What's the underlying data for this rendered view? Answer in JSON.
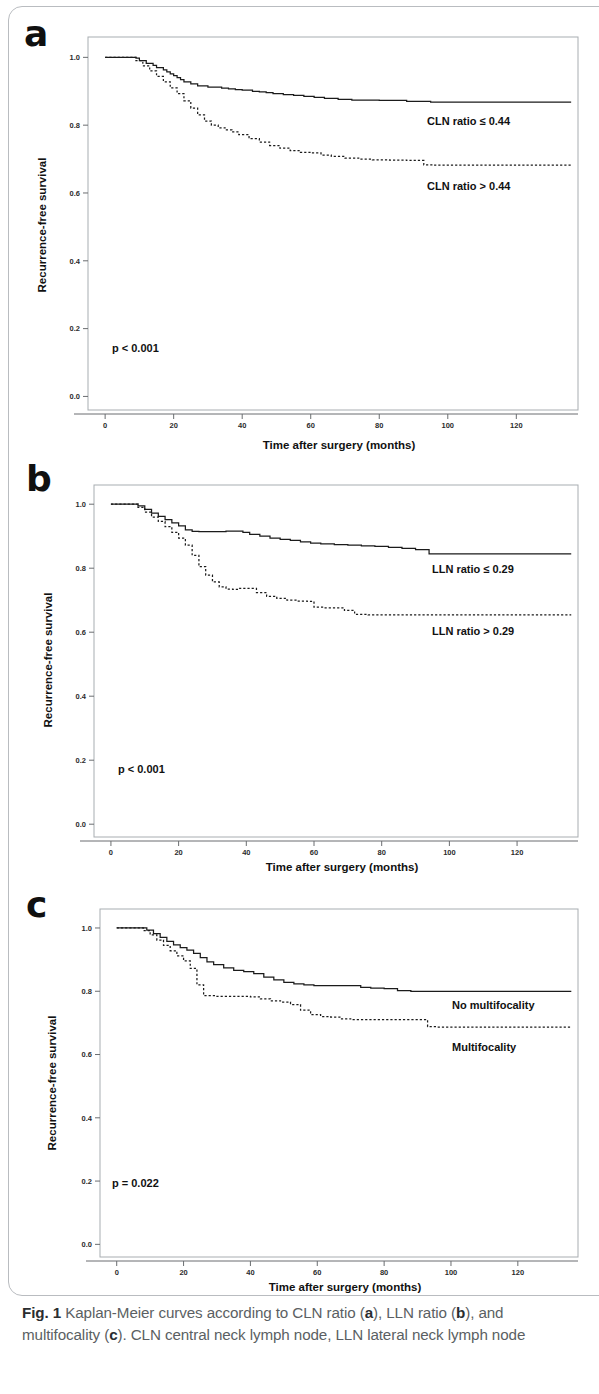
{
  "figure": {
    "caption_prefix": "Fig. 1",
    "caption_text_1": " Kaplan-Meier curves according to CLN ratio (",
    "caption_a": "a",
    "caption_text_2": "), LLN ratio (",
    "caption_b": "b",
    "caption_text_3": "), and multifocality (",
    "caption_c": "c",
    "caption_text_4": "). CLN central neck lymph node, LLN lateral neck lymph node"
  },
  "common": {
    "xlabel": "Time after surgery (months)",
    "ylabel": "Recurrence-free survival",
    "xticks": [
      "0",
      "20",
      "40",
      "60",
      "80",
      "100",
      "120"
    ],
    "yticks": [
      "0.0",
      "0.2",
      "0.4",
      "0.6",
      "0.8",
      "1.0"
    ]
  },
  "panels": [
    {
      "letter": "a",
      "pvalue": "p < 0.001",
      "label_upper": "CLN ratio ≤ 0.44",
      "label_lower": "CLN ratio > 0.44"
    },
    {
      "letter": "b",
      "pvalue": "p < 0.001",
      "label_upper": "LLN ratio ≤ 0.29",
      "label_lower": "LLN ratio > 0.29"
    },
    {
      "letter": "c",
      "pvalue": "p = 0.022",
      "label_upper": "No multifocality",
      "label_lower": "Multifocality"
    }
  ],
  "chart_data": [
    {
      "type": "line",
      "panel": "a",
      "title": "Kaplan-Meier curves according to CLN ratio",
      "xlabel": "Time after surgery (months)",
      "ylabel": "Recurrence-free survival",
      "xlim": [
        -5,
        138
      ],
      "ylim": [
        -0.04,
        1.06
      ],
      "xticks": [
        0,
        20,
        40,
        60,
        80,
        100,
        120
      ],
      "yticks": [
        0.0,
        0.2,
        0.4,
        0.6,
        0.8,
        1.0
      ],
      "grid": false,
      "legend": "inline-annotation",
      "annotations": [
        "p < 0.001"
      ],
      "series": [
        {
          "name": "CLN ratio ≤ 0.44",
          "style": "solid",
          "x": [
            0,
            7,
            9,
            10,
            12,
            14,
            15,
            17,
            18,
            19,
            20,
            21,
            22,
            23,
            25,
            27,
            30,
            32,
            34,
            36,
            38,
            40,
            43,
            45,
            47,
            49,
            52,
            55,
            58,
            61,
            64,
            68,
            72,
            74,
            80,
            88,
            95,
            105,
            120,
            136
          ],
          "y": [
            1.0,
            1.0,
            0.998,
            0.99,
            0.982,
            0.976,
            0.97,
            0.963,
            0.957,
            0.951,
            0.946,
            0.94,
            0.934,
            0.928,
            0.922,
            0.916,
            0.912,
            0.912,
            0.909,
            0.907,
            0.905,
            0.903,
            0.9,
            0.898,
            0.896,
            0.893,
            0.89,
            0.888,
            0.885,
            0.882,
            0.879,
            0.876,
            0.874,
            0.874,
            0.873,
            0.87,
            0.868,
            0.868,
            0.868,
            0.868
          ]
        },
        {
          "name": "CLN ratio > 0.44",
          "style": "dotted",
          "x": [
            0,
            7,
            9,
            11,
            13,
            15,
            17,
            19,
            21,
            23,
            25,
            27,
            29,
            31,
            33,
            35,
            37,
            39,
            42,
            45,
            48,
            51,
            54,
            57,
            60,
            63,
            66,
            70,
            74,
            78,
            83,
            88,
            93,
            96,
            105,
            120,
            136
          ],
          "y": [
            1.0,
            1.0,
            0.99,
            0.975,
            0.96,
            0.944,
            0.928,
            0.91,
            0.893,
            0.872,
            0.85,
            0.83,
            0.812,
            0.8,
            0.792,
            0.786,
            0.78,
            0.772,
            0.76,
            0.75,
            0.74,
            0.732,
            0.725,
            0.72,
            0.718,
            0.712,
            0.708,
            0.703,
            0.7,
            0.698,
            0.697,
            0.696,
            0.683,
            0.682,
            0.682,
            0.682,
            0.682
          ]
        }
      ]
    },
    {
      "type": "line",
      "panel": "b",
      "title": "Kaplan-Meier curves according to LLN ratio",
      "xlabel": "Time after surgery (months)",
      "ylabel": "Recurrence-free survival",
      "xlim": [
        -5,
        138
      ],
      "ylim": [
        -0.04,
        1.06
      ],
      "xticks": [
        0,
        20,
        40,
        60,
        80,
        100,
        120
      ],
      "yticks": [
        0.0,
        0.2,
        0.4,
        0.6,
        0.8,
        1.0
      ],
      "grid": false,
      "legend": "inline-annotation",
      "annotations": [
        "p < 0.001"
      ],
      "series": [
        {
          "name": "LLN ratio ≤ 0.29",
          "style": "solid",
          "x": [
            0,
            6,
            8,
            10,
            12,
            14,
            16,
            18,
            20,
            22,
            24,
            26,
            30,
            34,
            37,
            39,
            41,
            44,
            47,
            50,
            53,
            56,
            59,
            62,
            66,
            70,
            74,
            78,
            82,
            86,
            90,
            94,
            96,
            105,
            120,
            136
          ],
          "y": [
            1.0,
            1.0,
            0.995,
            0.984,
            0.972,
            0.962,
            0.952,
            0.942,
            0.932,
            0.92,
            0.915,
            0.914,
            0.914,
            0.916,
            0.916,
            0.912,
            0.906,
            0.9,
            0.894,
            0.89,
            0.887,
            0.882,
            0.878,
            0.876,
            0.874,
            0.872,
            0.87,
            0.868,
            0.865,
            0.862,
            0.858,
            0.845,
            0.845,
            0.845,
            0.845,
            0.845
          ]
        },
        {
          "name": "LLN ratio > 0.29",
          "style": "dotted",
          "x": [
            0,
            6,
            8,
            10,
            12,
            14,
            16,
            18,
            20,
            22,
            24,
            26,
            28,
            30,
            32,
            34,
            36,
            38,
            40,
            43,
            46,
            49,
            52,
            55,
            58,
            60,
            63,
            66,
            69,
            72,
            76,
            82,
            90,
            100,
            115,
            136
          ],
          "y": [
            1.0,
            1.0,
            0.99,
            0.975,
            0.96,
            0.946,
            0.93,
            0.912,
            0.894,
            0.872,
            0.84,
            0.805,
            0.778,
            0.757,
            0.742,
            0.735,
            0.734,
            0.737,
            0.737,
            0.724,
            0.712,
            0.706,
            0.7,
            0.697,
            0.696,
            0.678,
            0.676,
            0.676,
            0.668,
            0.656,
            0.654,
            0.654,
            0.654,
            0.654,
            0.654,
            0.654
          ]
        }
      ]
    },
    {
      "type": "line",
      "panel": "c",
      "title": "Kaplan-Meier curves according to multifocality",
      "xlabel": "Time after surgery (months)",
      "ylabel": "Recurrence-free survival",
      "xlim": [
        -5,
        138
      ],
      "ylim": [
        -0.04,
        1.06
      ],
      "xticks": [
        0,
        20,
        40,
        60,
        80,
        100,
        120
      ],
      "yticks": [
        0.0,
        0.2,
        0.4,
        0.6,
        0.8,
        1.0
      ],
      "grid": false,
      "legend": "inline-annotation",
      "annotations": [
        "p = 0.022"
      ],
      "series": [
        {
          "name": "No multifocality",
          "style": "solid",
          "x": [
            0,
            7,
            9,
            11,
            13,
            15,
            17,
            19,
            21,
            23,
            25,
            27,
            29,
            32,
            35,
            38,
            41,
            44,
            47,
            50,
            53,
            56,
            59,
            62,
            66,
            70,
            73,
            76,
            80,
            84,
            88,
            95,
            110,
            136
          ],
          "y": [
            1.0,
            1.0,
            0.993,
            0.982,
            0.97,
            0.958,
            0.947,
            0.938,
            0.93,
            0.92,
            0.906,
            0.893,
            0.884,
            0.874,
            0.866,
            0.862,
            0.856,
            0.845,
            0.836,
            0.828,
            0.823,
            0.82,
            0.818,
            0.818,
            0.818,
            0.818,
            0.812,
            0.81,
            0.808,
            0.802,
            0.8,
            0.8,
            0.8,
            0.8
          ]
        },
        {
          "name": "Multifocality",
          "style": "dotted",
          "x": [
            0,
            6,
            8,
            10,
            12,
            14,
            16,
            18,
            20,
            22,
            24,
            26,
            30,
            35,
            40,
            43,
            46,
            49,
            52,
            55,
            58,
            61,
            64,
            67,
            70,
            76,
            82,
            88,
            93,
            96,
            110,
            136
          ],
          "y": [
            1.0,
            1.0,
            0.992,
            0.978,
            0.962,
            0.945,
            0.928,
            0.912,
            0.896,
            0.872,
            0.82,
            0.786,
            0.784,
            0.784,
            0.782,
            0.776,
            0.77,
            0.766,
            0.758,
            0.74,
            0.726,
            0.72,
            0.718,
            0.713,
            0.71,
            0.71,
            0.71,
            0.71,
            0.688,
            0.687,
            0.687,
            0.687
          ]
        }
      ]
    }
  ]
}
